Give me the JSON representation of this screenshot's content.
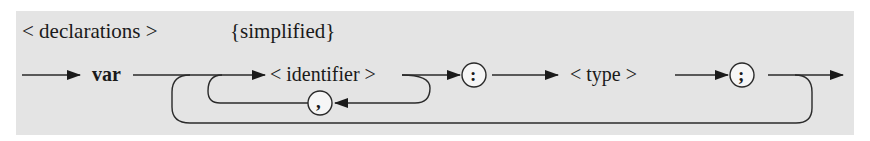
{
  "diagram": {
    "title": "< declarations >",
    "subtitle": "{simplified}",
    "nodes": [
      {
        "id": "var",
        "kind": "keyword",
        "label": "var"
      },
      {
        "id": "identifier",
        "kind": "nonterminal",
        "label": "< identifier >"
      },
      {
        "id": "comma",
        "kind": "terminal",
        "label": ","
      },
      {
        "id": "colon",
        "kind": "terminal",
        "label": ":"
      },
      {
        "id": "type",
        "kind": "nonterminal",
        "label": "< type >"
      },
      {
        "id": "semicolon",
        "kind": "terminal",
        "label": ";"
      }
    ],
    "edges": [
      {
        "from": "start",
        "to": "var"
      },
      {
        "from": "var",
        "to": "identifier"
      },
      {
        "from": "identifier",
        "to": "colon"
      },
      {
        "from": "identifier",
        "to": "comma",
        "note": "loop back"
      },
      {
        "from": "comma",
        "to": "identifier"
      },
      {
        "from": "colon",
        "to": "type"
      },
      {
        "from": "type",
        "to": "semicolon"
      },
      {
        "from": "semicolon",
        "to": "end"
      },
      {
        "from": "semicolon",
        "to": "identifier",
        "note": "outer repeat loop"
      }
    ],
    "colors": {
      "background": "#e4e4e4",
      "stroke": "#2a2a2a",
      "text": "#1a1a1a"
    }
  }
}
